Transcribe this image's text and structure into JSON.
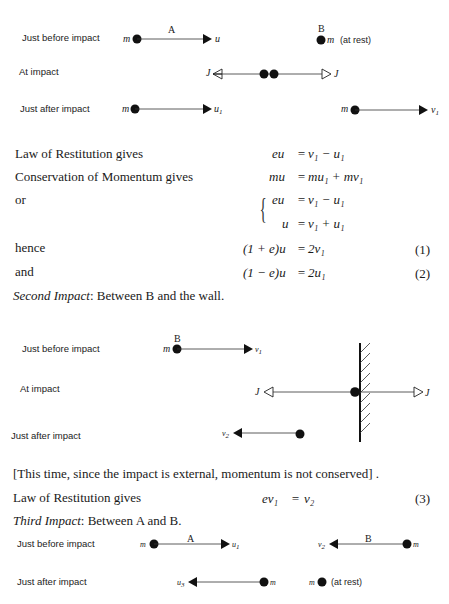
{
  "diagram1": {
    "rows": [
      "Just before impact",
      "At impact",
      "Just after impact"
    ],
    "label_A": "A",
    "label_B": "B",
    "mass": "m",
    "at_rest": "(at rest)",
    "u": "u",
    "J": "J",
    "u1": "u",
    "v1": "v"
  },
  "equations": [
    {
      "label": "Law of Restitution gives",
      "lhs": "eu",
      "rhs": "v₁ − u₁",
      "num": ""
    },
    {
      "label": "Conservation of Momentum gives",
      "lhs": "mu",
      "rhs": "mu₁ + mv₁",
      "num": ""
    },
    {
      "label": "or",
      "lhs": "eu",
      "rhs": "v₁ − u₁",
      "num": ""
    },
    {
      "label": "",
      "lhs": "u",
      "rhs": "v₁ + u₁",
      "num": ""
    },
    {
      "label": "hence",
      "lhs": "(1 + e)u",
      "rhs": "2v₁",
      "num": "(1)"
    },
    {
      "label": "and",
      "lhs": "(1 − e)u",
      "rhs": "2u₁",
      "num": "(2)"
    }
  ],
  "second_impact": {
    "title": "Second Impact",
    "rest": ": Between B and the wall."
  },
  "diagram2": {
    "rows": [
      "Just before impact",
      "At impact",
      "Just after impact"
    ],
    "label_B": "B"
  },
  "note": "[This time, since the impact is external, momentum is not conserved] .",
  "eq3": {
    "label": "Law of Restitution gives",
    "lhs": "ev₁",
    "rhs": "v₂",
    "num": "(3)"
  },
  "third_impact": {
    "title": "Third Impact",
    "rest": ": Between A and B."
  },
  "diagram3": {
    "rows": [
      "Just before impact",
      "Just after impact"
    ],
    "label_A": "A",
    "label_B": "B",
    "at_rest": "(at rest)"
  }
}
